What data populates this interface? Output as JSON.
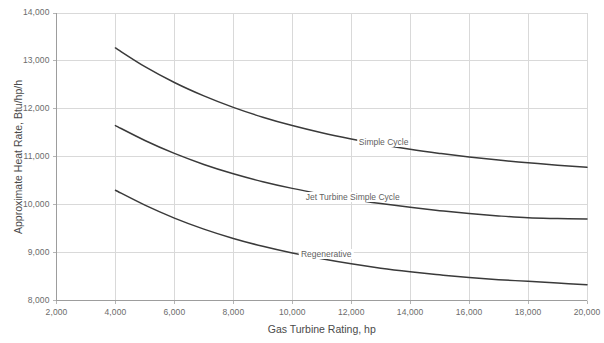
{
  "chart_data": {
    "type": "line",
    "title": "",
    "xlabel": "Gas Turbine Rating, hp",
    "ylabel": "Approximate Heat Rate, Btu/hp/h",
    "xlim": [
      2000,
      20000
    ],
    "ylim": [
      8000,
      14000
    ],
    "xticks": [
      2000,
      4000,
      6000,
      8000,
      10000,
      12000,
      14000,
      16000,
      18000,
      20000
    ],
    "yticks": [
      8000,
      9000,
      10000,
      11000,
      12000,
      13000,
      14000
    ],
    "xtick_labels": [
      "2,000",
      "4,000",
      "6,000",
      "8,000",
      "10,000",
      "12,000",
      "14,000",
      "16,000",
      "18,000",
      "20,000"
    ],
    "ytick_labels": [
      "8,000",
      "9,000",
      "10,000",
      "11,000",
      "12,000",
      "13,000",
      "14,000"
    ],
    "grid": true,
    "legend_position": "inline-annotations",
    "line_color": "#3a3a3a",
    "grid_color": "#d9d9d9",
    "axis_color": "#b5b5b5",
    "x": [
      4000,
      5000,
      6000,
      7000,
      8000,
      9000,
      10000,
      11000,
      12000,
      13000,
      14000,
      15000,
      16000,
      17000,
      18000,
      19000,
      20000
    ],
    "series": [
      {
        "name": "Simple Cycle",
        "label_x": 13100,
        "label_y": 11280,
        "values": [
          13270,
          12880,
          12550,
          12270,
          12030,
          11825,
          11650,
          11500,
          11370,
          11255,
          11155,
          11070,
          10995,
          10930,
          10875,
          10825,
          10780
        ]
      },
      {
        "name": "Jet Turbine Simple Cycle",
        "label_x": 12050,
        "label_y": 10130,
        "values": [
          11650,
          11340,
          11070,
          10840,
          10645,
          10480,
          10340,
          10220,
          10115,
          10025,
          9945,
          9875,
          9815,
          9765,
          9725,
          9710,
          9700
        ]
      },
      {
        "name": "Regenerative",
        "label_x": 11150,
        "label_y": 8960,
        "values": [
          10300,
          9990,
          9720,
          9490,
          9295,
          9130,
          8990,
          8870,
          8765,
          8675,
          8600,
          8535,
          8480,
          8435,
          8400,
          8365,
          8330
        ]
      }
    ]
  }
}
